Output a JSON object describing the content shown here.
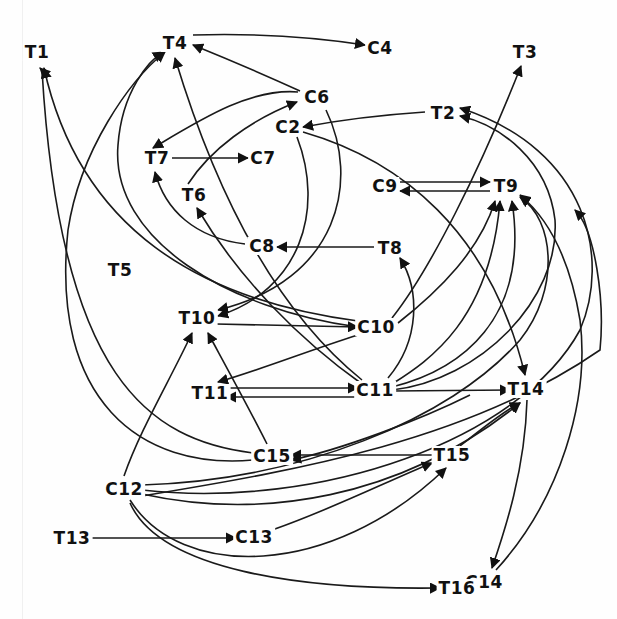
{
  "diagram": {
    "type": "directed-graph",
    "style": {
      "ink_color": "#111111",
      "background": "#fefefe"
    },
    "nodes": [
      {
        "id": "T1",
        "label": "T1",
        "x": 37,
        "y": 52
      },
      {
        "id": "T4",
        "label": "T4",
        "x": 175,
        "y": 43
      },
      {
        "id": "C4",
        "label": "C4",
        "x": 380,
        "y": 48
      },
      {
        "id": "T3",
        "label": "T3",
        "x": 525,
        "y": 52
      },
      {
        "id": "C6",
        "label": "C6",
        "x": 317,
        "y": 97
      },
      {
        "id": "T2",
        "label": "T2",
        "x": 443,
        "y": 113
      },
      {
        "id": "C2",
        "label": "C2",
        "x": 288,
        "y": 127
      },
      {
        "id": "T7",
        "label": "T7",
        "x": 157,
        "y": 158
      },
      {
        "id": "C7",
        "label": "C7",
        "x": 263,
        "y": 158
      },
      {
        "id": "C9",
        "label": "C9",
        "x": 385,
        "y": 186
      },
      {
        "id": "T9",
        "label": "T9",
        "x": 506,
        "y": 186
      },
      {
        "id": "T6",
        "label": "T6",
        "x": 194,
        "y": 195
      },
      {
        "id": "C8",
        "label": "C8",
        "x": 262,
        "y": 246
      },
      {
        "id": "T8",
        "label": "T8",
        "x": 390,
        "y": 248
      },
      {
        "id": "T5",
        "label": "T5",
        "x": 120,
        "y": 270
      },
      {
        "id": "T10",
        "label": "T10",
        "x": 197,
        "y": 318
      },
      {
        "id": "C10",
        "label": "C10",
        "x": 376,
        "y": 327
      },
      {
        "id": "T11",
        "label": "T11",
        "x": 210,
        "y": 393
      },
      {
        "id": "C11",
        "label": "C11",
        "x": 375,
        "y": 390
      },
      {
        "id": "T14",
        "label": "T14",
        "x": 526,
        "y": 389
      },
      {
        "id": "C15",
        "label": "C15",
        "x": 272,
        "y": 456
      },
      {
        "id": "T15",
        "label": "T15",
        "x": 452,
        "y": 455
      },
      {
        "id": "C12",
        "label": "C12",
        "x": 124,
        "y": 489
      },
      {
        "id": "T13",
        "label": "T13",
        "x": 72,
        "y": 538
      },
      {
        "id": "C13",
        "label": "C13",
        "x": 254,
        "y": 537
      },
      {
        "id": "C14",
        "label": "C14",
        "x": 484,
        "y": 582
      },
      {
        "id": "T16",
        "label": "T16",
        "x": 457,
        "y": 588
      }
    ],
    "edges": [
      {
        "from": "T4",
        "to": "C4",
        "d": "M193,35 C260,33 320,38 365,45"
      },
      {
        "from": "C6",
        "to": "T4",
        "d": "M300,91 C265,75 225,58 193,45"
      },
      {
        "from": "C6",
        "to": "T7",
        "d": "M298,92 C250,88 200,120 153,148"
      },
      {
        "from": "T6",
        "to": "C6",
        "d": "M188,184 C210,150 250,120 297,102"
      },
      {
        "from": "T7",
        "to": "C7",
        "d": "M172,158 L248,158"
      },
      {
        "from": "T2",
        "to": "C2",
        "d": "M425,112 C380,115 340,120 303,127"
      },
      {
        "from": "C9",
        "to": "T9",
        "d": "M400,182 L490,182"
      },
      {
        "from": "T9",
        "to": "C9",
        "d": "M490,191 L400,191"
      },
      {
        "from": "T8",
        "to": "C8",
        "d": "M374,247 L277,247"
      },
      {
        "from": "C8",
        "to": "T7",
        "d": "M245,244 C195,238 165,210 155,172"
      },
      {
        "from": "C10",
        "to": "T3",
        "d": "M392,318 C430,270 480,170 521,66"
      },
      {
        "from": "C10",
        "to": "T9",
        "d": "M398,323 C440,290 480,250 495,201"
      },
      {
        "from": "C10",
        "to": "T1",
        "d": "M358,321 C200,300 80,230 44,68"
      },
      {
        "from": "C10",
        "to": "T4",
        "d": "M358,327 C230,310 110,240 118,145 C122,90 150,60 163,52"
      },
      {
        "from": "C10",
        "to": "T11",
        "d": "M358,335 C310,350 260,370 218,382"
      },
      {
        "from": "T10",
        "to": "C10",
        "d": "M216,324 L358,327"
      },
      {
        "from": "C6",
        "to": "T10",
        "d": "M326,110 C360,180 340,280 218,310"
      },
      {
        "from": "C2",
        "to": "T10",
        "d": "M297,137 C325,210 300,290 218,316"
      },
      {
        "from": "C2",
        "to": "T14",
        "d": "M303,132 C400,160 490,230 525,375"
      },
      {
        "from": "C11",
        "to": "T4",
        "d": "M362,380 C300,330 230,240 175,58"
      },
      {
        "from": "C11",
        "to": "T6",
        "d": "M362,384 C300,340 240,280 197,208"
      },
      {
        "from": "C11",
        "to": "T8",
        "d": "M388,378 C420,340 420,290 400,258"
      },
      {
        "from": "C11",
        "to": "T9",
        "d": "M392,384 C430,360 490,320 500,201"
      },
      {
        "from": "C11",
        "to": "T9b",
        "d": "M392,387 C460,370 530,320 512,201"
      },
      {
        "from": "C11",
        "to": "T2",
        "d": "M392,390 C480,380 560,300 555,220 C548,160 500,125 460,116"
      },
      {
        "from": "C11",
        "to": "T14",
        "d": "M392,391 L510,390"
      },
      {
        "from": "T11",
        "to": "C11",
        "d": "M226,388 L358,388"
      },
      {
        "from": "C11",
        "to": "T11",
        "d": "M358,397 L226,397"
      },
      {
        "from": "C15",
        "to": "T10",
        "d": "M267,444 C250,410 228,370 208,333"
      },
      {
        "from": "C15",
        "to": "T1",
        "d": "M253,453 C150,440 60,380 42,70 L40,68"
      },
      {
        "from": "C15",
        "to": "T4",
        "d": "M253,460 C140,470 50,400 68,230 C80,150 130,80 165,52"
      },
      {
        "from": "T15",
        "to": "C15",
        "d": "M434,455 L291,455"
      },
      {
        "from": "C12",
        "to": "T10",
        "d": "M124,476 C140,430 170,380 192,333"
      },
      {
        "from": "C12",
        "to": "T9",
        "d": "M142,485 C300,480 450,420 520,340 C560,290 555,220 520,197"
      },
      {
        "from": "C12",
        "to": "T2",
        "d": "M142,490 C320,510 520,440 580,330 C610,260 590,150 460,108"
      },
      {
        "from": "C12",
        "to": "T14",
        "d": "M142,494 C260,520 400,500 520,403"
      },
      {
        "from": "C12",
        "to": "T15",
        "d": "M130,500 C180,580 330,580 446,468"
      },
      {
        "from": "C12",
        "to": "T16",
        "d": "M130,503 C160,570 300,590 440,588"
      },
      {
        "from": "C13",
        "to": "T15",
        "d": "M272,530 C330,510 390,480 432,463"
      },
      {
        "from": "T13",
        "to": "C13",
        "d": "M90,538 L236,538"
      },
      {
        "from": "T14",
        "to": "C14",
        "d": "M527,400 C525,470 505,530 492,568"
      },
      {
        "from": "C14",
        "to": "T9",
        "d": "M496,570 C560,500 590,400 580,320 C570,260 550,220 520,195"
      },
      {
        "from": "T14b",
        "to": "C15",
        "d": "M470,395 C420,420 340,450 291,460"
      },
      {
        "from": "T15b",
        "to": "T14",
        "d": "M460,446 C480,430 505,410 520,403"
      },
      {
        "from": "C12b",
        "to": "T14b",
        "d": "M142,496 C300,470 470,440 600,350 C605,300 595,230 575,210"
      }
    ],
    "arrowhead_color": "#111111"
  }
}
